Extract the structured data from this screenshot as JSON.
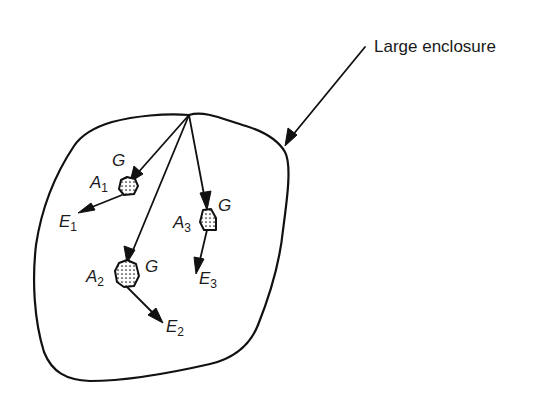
{
  "diagram": {
    "title_label": "Large enclosure",
    "irradiation_label": "G",
    "bodies": [
      {
        "id": "A1",
        "label_main": "A",
        "label_sub": "1",
        "emission_main": "E",
        "emission_sub": "1"
      },
      {
        "id": "A2",
        "label_main": "A",
        "label_sub": "2",
        "emission_main": "E",
        "emission_sub": "2"
      },
      {
        "id": "A3",
        "label_main": "A",
        "label_sub": "3",
        "emission_main": "E",
        "emission_sub": "3"
      }
    ],
    "colors": {
      "stroke": "#111111",
      "text": "#1a1a1a",
      "background": "#ffffff"
    }
  }
}
